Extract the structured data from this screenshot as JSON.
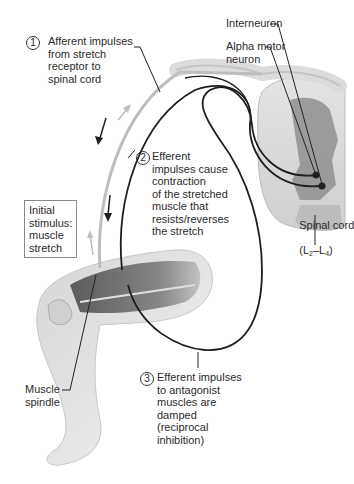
{
  "diagram": {
    "steps": [
      {
        "number": "1",
        "text": "Afferent impulses\nfrom stretch\nreceptor to\nspinal cord"
      },
      {
        "number": "2",
        "text": "Efferent\nimpulses cause\ncontraction\nof the stretched\nmuscle that\nresists/reverses\nthe stretch"
      },
      {
        "number": "3",
        "text": "Efferent impulses\nto antagonist\nmuscles are\ndamped\n(reciprocal\ninhibition)"
      }
    ],
    "labels": {
      "interneuron": "Interneuron",
      "alpha_motor_neuron": "Alpha motor\nneuron",
      "spinal_cord": "Spinal cord",
      "spinal_cord_level_open": "(L",
      "spinal_cord_sub1": "2",
      "spinal_cord_dash": "–L",
      "spinal_cord_sub2": "4",
      "spinal_cord_close": ")",
      "initial_stimulus": "Initial\nstimulus:\nmuscle\nstretch",
      "muscle_spindle": "Muscle\nspindle"
    },
    "colors": {
      "background": "#ffffff",
      "afferent_path": "#b8b8b8",
      "efferent_path": "#1e1e1e",
      "spinal_gray_matter": "#8c8c8c",
      "spinal_white_matter": "#dcdcdc",
      "skin": "#e6e6e6",
      "muscle": "#555555"
    }
  }
}
